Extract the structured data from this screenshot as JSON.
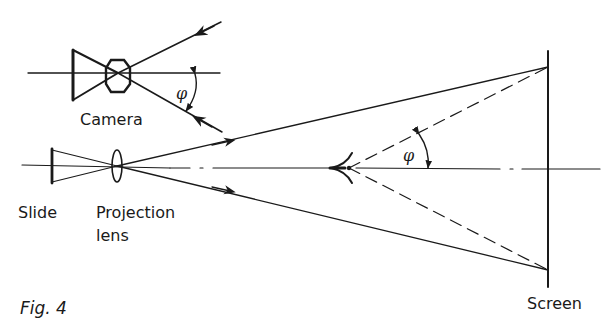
{
  "figure": {
    "caption": "Fig. 4"
  },
  "labels": {
    "camera": "Camera",
    "slide": "Slide",
    "projection_lens_line1": "Projection",
    "projection_lens_line2": "lens",
    "screen": "Screen",
    "camera_angle": "φ",
    "eye_angle": "φ"
  },
  "colors": {
    "ink": "#1a1a1a",
    "background": "#ffffff"
  }
}
